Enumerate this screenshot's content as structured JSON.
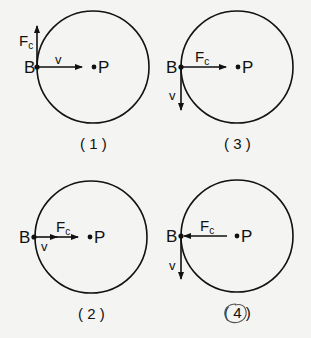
{
  "diagrams": [
    {
      "id": "1",
      "caption": "( 1 )",
      "point_b": "B",
      "point_p": "P",
      "force_label": "F",
      "force_sub": "c",
      "velocity_label": "v",
      "force_direction": "up",
      "velocity_direction": "toward-center"
    },
    {
      "id": "3",
      "caption": "( 3 )",
      "point_b": "B",
      "point_p": "P",
      "force_label": "F",
      "force_sub": "c",
      "velocity_label": "v",
      "force_direction": "toward-center",
      "velocity_direction": "down"
    },
    {
      "id": "2",
      "caption": "( 2 )",
      "point_b": "B",
      "point_p": "P",
      "force_label": "F",
      "force_sub": "c",
      "velocity_label": "v",
      "force_direction": "toward-center",
      "velocity_direction": "toward-center"
    },
    {
      "id": "4",
      "caption": "( 4 )",
      "point_b": "B",
      "point_p": "P",
      "force_label": "F",
      "force_sub": "c",
      "velocity_label": "v",
      "force_direction": "toward-center (from P to B)",
      "velocity_direction": "down",
      "circled_answer": true
    }
  ],
  "colors": {
    "ink": "#111111",
    "background": "#f4f4f2",
    "answer_mark": "#555555"
  }
}
